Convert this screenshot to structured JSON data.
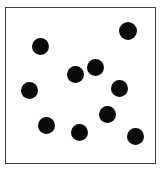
{
  "figure": {
    "background_color": "#ffffff",
    "frame": {
      "x": 5,
      "y": 7,
      "width": 151,
      "height": 157,
      "border_color": "#3f3f3f",
      "border_width": 1.5,
      "fill_color": "#ffffff"
    }
  },
  "chart_data": {
    "type": "scatter",
    "title": "",
    "subtitle": "",
    "xlabel": "",
    "ylabel": "",
    "xlim": [
      0,
      162
    ],
    "ylim": [
      0,
      171
    ],
    "grid": false,
    "legend": null,
    "axis_ticks": false,
    "tick_labels": [],
    "annotations": [],
    "marker": {
      "shape": "circle",
      "color": "#0a0a0a",
      "diameter": 17,
      "edge_color": "#0a0a0a"
    },
    "point_count": 11,
    "series": [
      {
        "name": "dots",
        "color": "#0a0a0a",
        "points": [
          {
            "x": 41,
            "y": 47,
            "d": 17
          },
          {
            "x": 128,
            "y": 31,
            "d": 18
          },
          {
            "x": 96,
            "y": 68,
            "d": 17
          },
          {
            "x": 76,
            "y": 75,
            "d": 17
          },
          {
            "x": 30,
            "y": 91,
            "d": 17
          },
          {
            "x": 120,
            "y": 89,
            "d": 17
          },
          {
            "x": 108,
            "y": 115,
            "d": 17
          },
          {
            "x": 47,
            "y": 126,
            "d": 17
          },
          {
            "x": 80,
            "y": 133,
            "d": 17
          },
          {
            "x": 136,
            "y": 137,
            "d": 17
          },
          {
            "x": 17,
            "y": 96,
            "d": 0
          }
        ]
      }
    ]
  }
}
